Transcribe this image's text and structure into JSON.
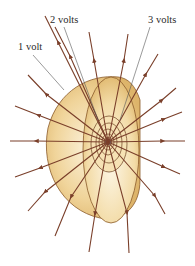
{
  "figure": {
    "labels": [
      {
        "text": "1 volt",
        "x": 18,
        "y": 42
      },
      {
        "text": "2 volts",
        "x": 50,
        "y": 15
      },
      {
        "text": "3 volts",
        "x": 148,
        "y": 15
      }
    ],
    "center": {
      "x": 108,
      "y": 142
    },
    "colors": {
      "field_line": "#7a3f2a",
      "surface_outer": "#e9c98a",
      "surface_mid": "#f0d49a",
      "surface_light": "#f8ecd0",
      "surface_edge": "#8a5a2a",
      "charge": "#5a7a9a",
      "leader": "#555555"
    }
  }
}
